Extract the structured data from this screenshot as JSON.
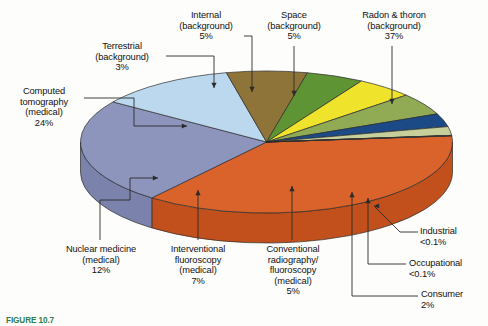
{
  "figure": {
    "caption_prefix": "FIGURE 10.7",
    "caption_text": "Average radiation dose to which the population is exposed."
  },
  "chart_data": {
    "type": "pie",
    "title": "",
    "subtitle": "",
    "xlabel": "",
    "ylabel": "",
    "legend_position": "none",
    "grid": false,
    "three_d": true,
    "total": 100,
    "unit": "%",
    "categories": [
      "Radon & thoron (background)",
      "Computed tomography (medical)",
      "Nuclear medicine (medical)",
      "Interventional fluoroscopy (medical)",
      "Conventional radiography/fluoroscopy (medical)",
      "Internal (background)",
      "Space (background)",
      "Terrestrial (background)",
      "Consumer",
      "Occupational",
      "Industrial"
    ],
    "values": [
      37,
      24,
      12,
      7,
      5,
      5,
      5,
      3,
      2,
      0.05,
      0.05
    ],
    "value_labels": [
      "37%",
      "24%",
      "12%",
      "7%",
      "5%",
      "5%",
      "5%",
      "3%",
      "2%",
      "<0.1%",
      "<0.1%"
    ],
    "colors": [
      "#d9632a",
      "#8e95bd",
      "#bcd8ee",
      "#8f7439",
      "#5f9434",
      "#f0e32c",
      "#90ab54",
      "#1b4a86",
      "#c7cf9a",
      "#4d4d4d",
      "#f2efe4"
    ],
    "side_colors": [
      "#c1501d",
      "#7b82ab",
      "#a6c6e0",
      "#7d6430",
      "#4f7f29",
      "#dccd23",
      "#7d9747",
      "#133a6c",
      "#b4bd86",
      "#3b3b3b",
      "#ddd9cb"
    ]
  },
  "callouts": [
    {
      "name": "internal-background",
      "label": "Internal\n(background)\n5%",
      "value": "5%"
    },
    {
      "name": "space-background",
      "label": "Space\n(background)\n5%",
      "value": "5%"
    },
    {
      "name": "radon-thoron-background",
      "label": "Radon & thoron\n(background)\n37%",
      "value": "37%"
    },
    {
      "name": "terrestrial-background",
      "label": "Terrestrial\n(background)\n3%",
      "value": "3%"
    },
    {
      "name": "computed-tomography",
      "label": "Computed\ntomography\n(medical)\n24%",
      "value": "24%"
    },
    {
      "name": "nuclear-medicine",
      "label": "Nuclear medicine\n(medical)\n12%",
      "value": "12%"
    },
    {
      "name": "interventional-fluoroscopy",
      "label": "Interventional\nfluoroscopy\n(medical)\n7%",
      "value": "7%"
    },
    {
      "name": "conventional-radiography",
      "label": "Conventional\nradiography/\nfluoroscopy\n(medical)\n5%",
      "value": "5%"
    },
    {
      "name": "industrial",
      "label": "Industrial\n<0.1%",
      "value": "<0.1%"
    },
    {
      "name": "occupational",
      "label": "Occupational\n<0.1%",
      "value": "<0.1%"
    },
    {
      "name": "consumer",
      "label": "Consumer\n2%",
      "value": "2%"
    }
  ]
}
